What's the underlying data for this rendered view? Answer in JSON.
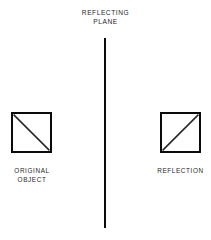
{
  "diagram": {
    "title": {
      "line1": "REFLECTING",
      "line2": "PLANE"
    },
    "mirror": {
      "name": "reflecting-plane-line",
      "orientation": "vertical"
    },
    "figures": [
      {
        "id": "original",
        "shape": "square-with-diagonal",
        "diagonal_direction": "top-left-to-bottom-right",
        "caption_line1": "ORIGINAL",
        "caption_line2": "OBJECT"
      },
      {
        "id": "reflection",
        "shape": "square-with-diagonal",
        "diagonal_direction": "bottom-left-to-top-right",
        "caption_line1": "REFLECTION",
        "caption_line2": ""
      }
    ],
    "colors": {
      "background": "#ffffff",
      "stroke": "#0b0b0d",
      "text": "#26262a"
    }
  }
}
